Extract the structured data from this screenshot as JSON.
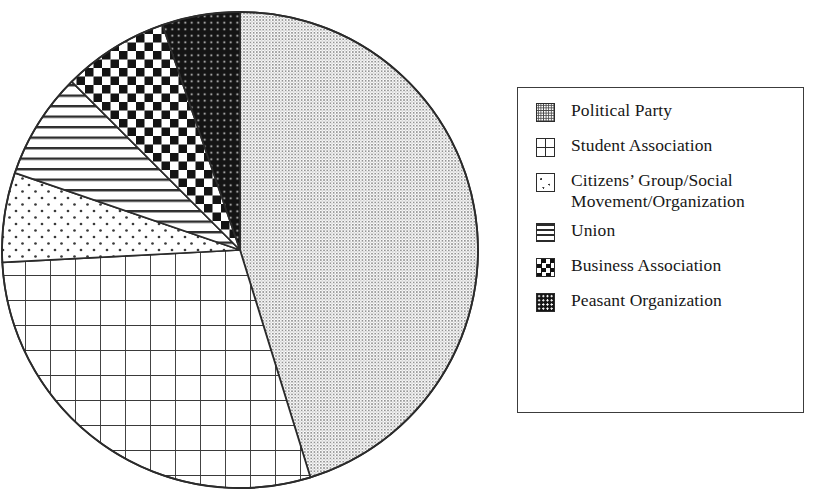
{
  "figure": {
    "background_color": "#ffffff",
    "ink_color": "#1a1a1a"
  },
  "legend": {
    "border_color": "#3c3c3c",
    "items": [
      {
        "label": "Political Party",
        "pattern": "fine-dot-gray",
        "swatch_class": "sw-political"
      },
      {
        "label": "Student Association",
        "pattern": "large-grid",
        "swatch_class": "sw-student"
      },
      {
        "label": "Citizens’ Group/Social\nMovement/Organization",
        "pattern": "sparse-dot",
        "swatch_class": "sw-citizens"
      },
      {
        "label": "Union",
        "pattern": "horizontal-lines",
        "swatch_class": "sw-union"
      },
      {
        "label": "Business Association",
        "pattern": "checkerboard",
        "swatch_class": "sw-business"
      },
      {
        "label": "Peasant Organization",
        "pattern": "dark-sparse-dot",
        "swatch_class": "sw-peasant"
      }
    ]
  },
  "chart_data": {
    "type": "pie",
    "title": "",
    "subtitle": "",
    "xlabel": "",
    "ylabel": "",
    "grid": false,
    "legend_position": "right",
    "start_angle_deg": 0,
    "direction": "clockwise",
    "center": {
      "x": 240,
      "y": 250
    },
    "radius": 238,
    "labels": [
      "Political Party",
      "Student Association",
      "Citizens’ Group/Social Movement/Organization",
      "Union",
      "Business Association",
      "Peasant Organization"
    ],
    "values": [
      45.2,
      29.0,
      6.1,
      7.3,
      7.2,
      5.2
    ],
    "units": "percent",
    "angles_deg": [
      162.8,
      104.2,
      21.9,
      26.1,
      26.0,
      19.0
    ],
    "slices": [
      {
        "label": "Political Party",
        "value": 45.2,
        "angle_deg": 162.8,
        "start_deg": 0.0,
        "end_deg": 162.8,
        "pattern": "fine-dot-gray",
        "fill_tone": "#b9b9b9"
      },
      {
        "label": "Student Association",
        "value": 29.0,
        "angle_deg": 104.2,
        "start_deg": 162.8,
        "end_deg": 267.0,
        "pattern": "large-grid",
        "fill_tone": "#ffffff"
      },
      {
        "label": "Citizens’ Group/Social Movement/Organization",
        "value": 6.1,
        "angle_deg": 21.9,
        "start_deg": 267.0,
        "end_deg": 288.9,
        "pattern": "sparse-dot",
        "fill_tone": "#ffffff"
      },
      {
        "label": "Union",
        "value": 7.3,
        "angle_deg": 26.1,
        "start_deg": 288.9,
        "end_deg": 315.0,
        "pattern": "horizontal-lines",
        "fill_tone": "#ffffff"
      },
      {
        "label": "Business Association",
        "value": 7.2,
        "angle_deg": 26.0,
        "start_deg": 315.0,
        "end_deg": 341.0,
        "pattern": "checkerboard",
        "fill_tone": "#555555"
      },
      {
        "label": "Peasant Organization",
        "value": 5.2,
        "angle_deg": 19.0,
        "start_deg": 341.0,
        "end_deg": 360.0,
        "pattern": "dark-sparse-dot",
        "fill_tone": "#141414"
      }
    ]
  }
}
